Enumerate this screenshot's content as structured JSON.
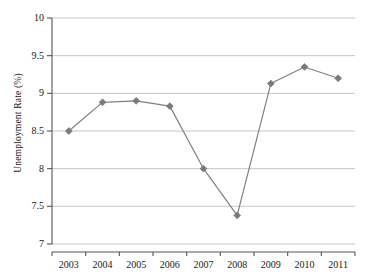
{
  "chart_data": {
    "type": "line",
    "title": "",
    "xlabel": "",
    "ylabel": "Unemployment Rate (%)",
    "categories": [
      "2003",
      "2004",
      "2005",
      "2006",
      "2007",
      "2008",
      "2009",
      "2010",
      "2011"
    ],
    "values": [
      8.5,
      8.88,
      8.9,
      8.83,
      8.0,
      7.38,
      9.13,
      9.35,
      9.2
    ],
    "series": [
      {
        "name": "Unemployment Rate",
        "values": [
          8.5,
          8.88,
          8.9,
          8.83,
          8.0,
          7.38,
          9.13,
          9.35,
          9.2
        ]
      }
    ],
    "ylim": [
      7,
      10
    ],
    "xlim": [
      "2003",
      "2011"
    ],
    "ytick_labels": [
      "10",
      "9.5",
      "9",
      "8.5",
      "8",
      "7.5",
      "7"
    ],
    "ytick_values": [
      10,
      9.5,
      9,
      8.5,
      8,
      7.5,
      7
    ],
    "grid": true,
    "grid_axis": "y",
    "legend": false,
    "legend_position": "none",
    "marker": "diamond",
    "colors": {
      "line": "#808080",
      "marker": "#7a7a7a",
      "grid": "#bfbfbf",
      "axis": "#555555",
      "background": "#ffffff",
      "text": "#1a1a1a"
    }
  },
  "axes": {
    "y_title": "Unemployment Rate (%)"
  }
}
